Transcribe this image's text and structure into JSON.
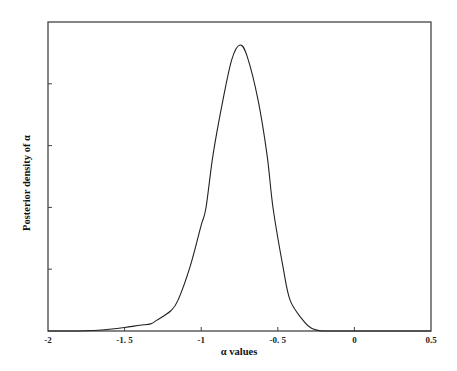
{
  "chart_data": {
    "type": "line",
    "title": "",
    "xlabel": "α values",
    "ylabel": "Posterior density of  α",
    "xlim": [
      -2,
      0.5
    ],
    "ylim": [
      0,
      1.1
    ],
    "x_ticks": [
      -2,
      -1.5,
      -1,
      -0.5,
      0,
      0.5
    ],
    "x_tick_labels": [
      "-2",
      "-1. 5",
      "-1",
      "-0. 5",
      "0",
      "0.5"
    ],
    "y_ticks_count": 4,
    "y_tick_labels": [],
    "grid": false,
    "legend": null,
    "series": [
      {
        "name": "Posterior density of α",
        "color": "#222222",
        "x": [
          -2.0,
          -1.8,
          -1.7,
          -1.6,
          -1.5,
          -1.4,
          -1.33,
          -1.289,
          -1.2,
          -1.151,
          -1.073,
          -1.0,
          -0.969,
          -0.923,
          -0.858,
          -0.8,
          -0.747,
          -0.7,
          -0.629,
          -0.57,
          -0.531,
          -0.466,
          -0.42,
          -0.336,
          -0.28,
          -0.2,
          0.0,
          0.5
        ],
        "y": [
          0.0,
          0.0,
          0.002,
          0.006,
          0.012,
          0.02,
          0.025,
          0.038,
          0.07,
          0.108,
          0.224,
          0.37,
          0.43,
          0.615,
          0.808,
          0.95,
          1.0,
          0.96,
          0.808,
          0.615,
          0.43,
          0.224,
          0.108,
          0.038,
          0.01,
          0.0,
          0.0,
          0.0
        ]
      }
    ],
    "peak": {
      "x": -0.75,
      "y": 1.0
    }
  },
  "labels": {
    "xlabel": "α values",
    "ylabel": "Posterior density of  α",
    "xticks": [
      "-2",
      "-1. 5",
      "-1",
      "-0. 5",
      "0",
      "0.5"
    ]
  }
}
